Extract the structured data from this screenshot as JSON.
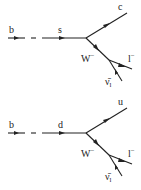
{
  "diagrams": [
    {
      "name": "b-to-c-semileptonic",
      "labels": {
        "incoming": "b",
        "internal": "s",
        "outgoing_quark": "c",
        "boson": "W",
        "boson_charge": "−",
        "lepton": "l",
        "lepton_charge": "−",
        "neutrino": "ν̄",
        "neutrino_sub": "l"
      }
    },
    {
      "name": "b-to-u-semileptonic",
      "labels": {
        "incoming": "b",
        "internal": "d",
        "outgoing_quark": "u",
        "boson": "W",
        "boson_charge": "−",
        "lepton": "l",
        "lepton_charge": "−",
        "neutrino": "ν̄",
        "neutrino_sub": "l"
      }
    }
  ]
}
